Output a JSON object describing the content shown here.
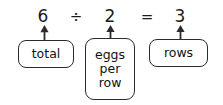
{
  "figure": {
    "kind": "division-equation-annotation-diagram",
    "background_color": "#ffffff",
    "stroke_color": "#2b2b2b",
    "text_color": "#111111"
  },
  "equation": {
    "dividend": "6",
    "operator_divide": "÷",
    "divisor": "2",
    "operator_equals": "=",
    "quotient": "3"
  },
  "labels": {
    "dividend_label": "total",
    "divisor_label_line1": "eggs",
    "divisor_label_line2": "per",
    "divisor_label_line3": "row",
    "quotient_label": "rows"
  },
  "arrows": {
    "dividend_arrow": "arrow-up",
    "divisor_arrow": "arrow-up",
    "quotient_arrow": "arrow-up"
  }
}
